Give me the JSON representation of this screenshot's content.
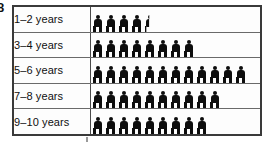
{
  "question_number": "8",
  "chart_data": {
    "type": "bar",
    "title": "",
    "subtitle": "",
    "xlabel": "",
    "ylabel": "",
    "categories": [
      "1–2 years",
      "3–4 years",
      "5–6 years",
      "7–8 years",
      "9–10 years"
    ],
    "values": [
      4.5,
      8,
      12,
      10,
      9
    ],
    "symbol_counts": [
      {
        "full": 4,
        "half": 1
      },
      {
        "full": 8,
        "half": 0
      },
      {
        "full": 12,
        "half": 0
      },
      {
        "full": 10,
        "half": 0
      },
      {
        "full": 9,
        "half": 0
      }
    ],
    "symbol": "person-icon",
    "legend": [],
    "grid": false,
    "orientation": "horizontal"
  },
  "colors": {
    "symbol": "#0d0d0d",
    "outer_border": "#3a3a3a",
    "row_divider": "#6a6a6a",
    "column_divider": "#4a4a4a",
    "background": "#ffffff",
    "text": "#101010"
  }
}
